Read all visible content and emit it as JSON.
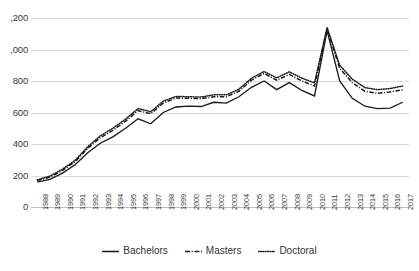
{
  "chart_data": {
    "type": "line",
    "title": "",
    "xlabel": "",
    "ylabel": "",
    "ylim": [
      0,
      1200
    ],
    "ytick_step": 200,
    "grid": true,
    "legend_position": "bottom",
    "note_axis_labels_clipped": "Top two y-axis labels are cut off at the left image edge, rendering as ',200' and ',000'",
    "x": [
      "1988",
      "1989",
      "1990",
      "1991",
      "1992",
      "1993",
      "1994",
      "1995",
      "1996",
      "1997",
      "1998",
      "1999",
      "2000",
      "2001",
      "2002",
      "2003",
      "2004",
      "2005",
      "2006",
      "2007",
      "2008",
      "2009",
      "2010",
      "2011",
      "2012",
      "2013",
      "2014",
      "2015",
      "2016",
      "2017"
    ],
    "yticks": [
      "0",
      "200",
      "400",
      "600",
      "800",
      ",000",
      ",200"
    ],
    "ytick_values": [
      0,
      200,
      400,
      600,
      800,
      1000,
      1200
    ],
    "series": [
      {
        "name": "Bachelors",
        "style": "solid",
        "color": "#1a1a1a",
        "values": [
          158,
          175,
          215,
          268,
          345,
          405,
          445,
          500,
          560,
          528,
          600,
          635,
          640,
          638,
          665,
          660,
          700,
          760,
          800,
          745,
          790,
          740,
          705,
          1120,
          800,
          690,
          640,
          625,
          628,
          665
        ]
      },
      {
        "name": "Masters",
        "style": "dash-dot",
        "color": "#1a1a1a",
        "values": [
          168,
          190,
          232,
          288,
          372,
          440,
          487,
          545,
          612,
          592,
          660,
          692,
          690,
          688,
          700,
          700,
          735,
          805,
          848,
          805,
          842,
          800,
          768,
          1132,
          880,
          790,
          735,
          722,
          730,
          745
        ]
      },
      {
        "name": "Doctoral",
        "style": "dotted",
        "color": "#1a1a1a",
        "values": [
          172,
          196,
          240,
          296,
          382,
          452,
          500,
          558,
          625,
          605,
          672,
          702,
          700,
          698,
          712,
          712,
          748,
          818,
          860,
          820,
          858,
          818,
          788,
          1140,
          900,
          812,
          758,
          745,
          752,
          768
        ]
      }
    ]
  },
  "legend": {
    "items": [
      {
        "label": "Bachelors",
        "style": "solid"
      },
      {
        "label": "Masters",
        "style": "dash-dot"
      },
      {
        "label": "Doctoral",
        "style": "dotted"
      }
    ]
  }
}
